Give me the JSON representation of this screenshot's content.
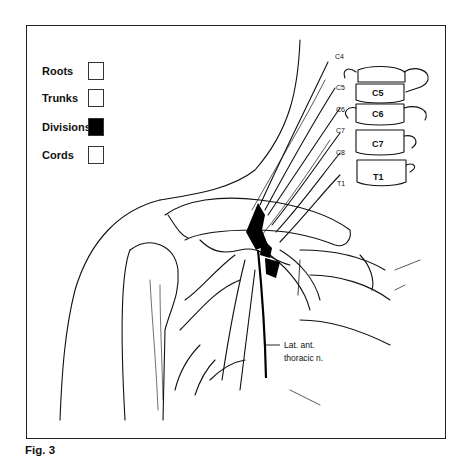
{
  "figure": {
    "caption": "Fig. 3",
    "legend": [
      {
        "label": "Roots",
        "fill": "#ffffff"
      },
      {
        "label": "Trunks",
        "fill": "#ffffff"
      },
      {
        "label": "Divisions",
        "fill": "#000000"
      },
      {
        "label": "Cords",
        "fill": "#ffffff"
      }
    ],
    "nerve_labels": {
      "c4": "C4",
      "c5": "C5",
      "c6": "C6",
      "c7": "C7",
      "c8": "C8",
      "t1": "T1"
    },
    "vertebra_labels": {
      "c5": "C5",
      "c6": "C6",
      "c7": "C7",
      "t1": "T1"
    },
    "annotation": {
      "line1": "Lat. ant.",
      "line2": "thoracic n."
    },
    "colors": {
      "ink": "#111111",
      "highlight": "#000000",
      "background": "#ffffff"
    }
  }
}
